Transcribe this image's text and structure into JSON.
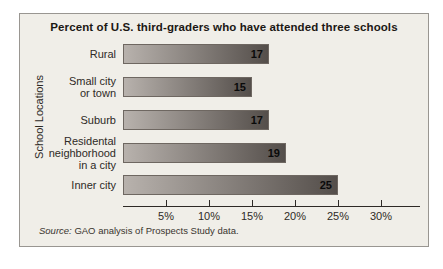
{
  "chart_data": {
    "type": "bar",
    "orientation": "horizontal",
    "title": "Percent of U.S. third-graders who have attended three schools",
    "ylabel": "School Locations",
    "categories": [
      "Rural",
      "Small city\nor town",
      "Suburb",
      "Residental\nneighborhood\nin a city",
      "Inner city"
    ],
    "values": [
      17,
      15,
      17,
      19,
      25
    ],
    "value_labels": [
      "17",
      "15",
      "17",
      "19",
      "25"
    ],
    "xtick_values": [
      5,
      10,
      15,
      20,
      25,
      30
    ],
    "xtick_labels": [
      "5%",
      "10%",
      "15%",
      "20%",
      "25%",
      "30%"
    ],
    "xlim": [
      0,
      34.5
    ],
    "grid": false,
    "value_label_position": "inside-right",
    "source_prefix": "Source:",
    "source_text": " GAO analysis of Prospects Study data."
  },
  "colors": {
    "page_background": "#ffffff",
    "panel_background": "#f0eee8",
    "panel_border": "#999691",
    "bar_gradient_left": "#b8b2ad",
    "bar_gradient_right": "#544e4a",
    "bar_border": "#6e6761",
    "axis": "#2e2a26",
    "title_text": "#1c1814",
    "label_text": "#2e2a26",
    "value_text": "#0a0a0a",
    "source_text": "#3a352f"
  }
}
